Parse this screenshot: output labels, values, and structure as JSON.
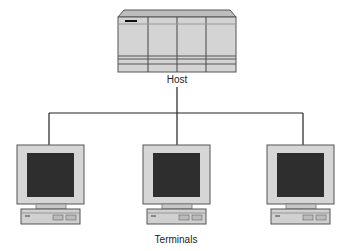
{
  "diagram": {
    "type": "network-topology",
    "host": {
      "label": "Host"
    },
    "terminals_label": "Terminals",
    "terminals": [
      {
        "id": "terminal-1"
      },
      {
        "id": "terminal-2"
      },
      {
        "id": "terminal-3"
      }
    ],
    "colors": {
      "host_fill": "#d4d4d4",
      "host_top": "#bdbdbd",
      "monitor_bezel": "#d6d6d6",
      "screen": "#2e2e2e",
      "line": "#222222",
      "base_fill": "#d0d0d0"
    }
  }
}
